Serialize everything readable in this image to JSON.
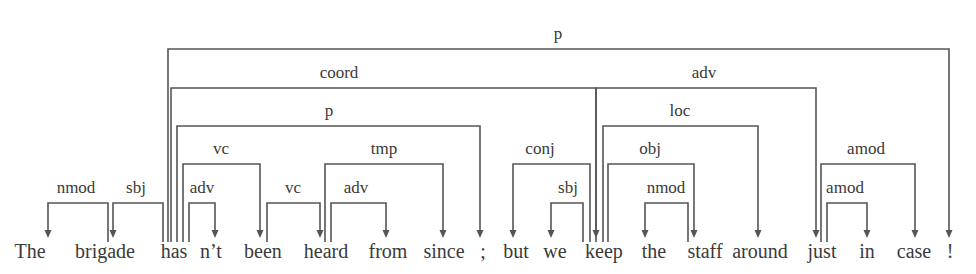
{
  "diagram": {
    "type": "dependency-parse",
    "word_baseline_y": 258,
    "arrow_end_y": 238,
    "color": "#555555",
    "words": [
      {
        "text": "The",
        "x": 30
      },
      {
        "text": "brigade",
        "x": 105
      },
      {
        "text": "has",
        "x": 174
      },
      {
        "text": "n’t",
        "x": 211
      },
      {
        "text": "been",
        "x": 263
      },
      {
        "text": "heard",
        "x": 326
      },
      {
        "text": "from",
        "x": 388
      },
      {
        "text": "since",
        "x": 444
      },
      {
        "text": ";",
        "x": 483
      },
      {
        "text": "but",
        "x": 516
      },
      {
        "text": "we",
        "x": 555
      },
      {
        "text": "keep",
        "x": 604
      },
      {
        "text": "the",
        "x": 654
      },
      {
        "text": "staff",
        "x": 705
      },
      {
        "text": "around",
        "x": 760
      },
      {
        "text": "just",
        "x": 822
      },
      {
        "text": "in",
        "x": 867
      },
      {
        "text": "case",
        "x": 914
      },
      {
        "text": "!",
        "x": 950
      }
    ],
    "arcs": [
      {
        "label": "p",
        "head": "has",
        "dep": "!",
        "x1": 168,
        "x2": 949,
        "y": 49,
        "label_x": 558
      },
      {
        "label": "coord",
        "head": "has",
        "dep": "keep",
        "x1": 171,
        "x2": 596,
        "y": 88,
        "label_x": 339
      },
      {
        "label": "p",
        "head": "has",
        "dep": ";",
        "x1": 177,
        "x2": 480,
        "y": 126,
        "label_x": 329
      },
      {
        "label": "vc",
        "head": "has",
        "dep": "been",
        "x1": 183,
        "x2": 260,
        "y": 164,
        "label_x": 221
      },
      {
        "label": "adv",
        "head": "has",
        "dep": "n’t",
        "x1": 189,
        "x2": 215,
        "y": 203,
        "label_x": 202
      },
      {
        "label": "sbj",
        "head": "has",
        "dep": "brigade",
        "x1": 163,
        "x2": 113,
        "y": 203,
        "label_x": 136
      },
      {
        "label": "nmod",
        "head": "brigade",
        "dep": "The",
        "x1": 108,
        "x2": 48,
        "y": 203,
        "label_x": 76
      },
      {
        "label": "vc",
        "head": "been",
        "dep": "heard",
        "x1": 267,
        "x2": 320,
        "y": 203,
        "label_x": 293
      },
      {
        "label": "tmp",
        "head": "heard",
        "dep": "since",
        "x1": 325,
        "x2": 443,
        "y": 164,
        "label_x": 384
      },
      {
        "label": "adv",
        "head": "heard",
        "dep": "from",
        "x1": 331,
        "x2": 386,
        "y": 203,
        "label_x": 356
      },
      {
        "label": "adv",
        "head": "keep",
        "dep": "just",
        "x1": 596,
        "x2": 816,
        "y": 88,
        "label_x": 704
      },
      {
        "label": "loc",
        "head": "keep",
        "dep": "around",
        "x1": 603,
        "x2": 758,
        "y": 126,
        "label_x": 680
      },
      {
        "label": "obj",
        "head": "keep",
        "dep": "staff",
        "x1": 608,
        "x2": 694,
        "y": 164,
        "label_x": 650
      },
      {
        "label": "conj",
        "head": "keep",
        "dep": "but",
        "x1": 590,
        "x2": 513,
        "y": 164,
        "label_x": 540
      },
      {
        "label": "sbj",
        "head": "keep",
        "dep": "we",
        "x1": 583,
        "x2": 551,
        "y": 203,
        "label_x": 568
      },
      {
        "label": "nmod",
        "head": "staff",
        "dep": "the",
        "x1": 688,
        "x2": 645,
        "y": 203,
        "label_x": 666
      },
      {
        "label": "amod",
        "head": "just",
        "dep": "case",
        "x1": 821,
        "x2": 915,
        "y": 164,
        "label_x": 866
      },
      {
        "label": "amod",
        "head": "just",
        "dep": "in",
        "x1": 827,
        "x2": 867,
        "y": 203,
        "label_x": 845
      }
    ]
  }
}
